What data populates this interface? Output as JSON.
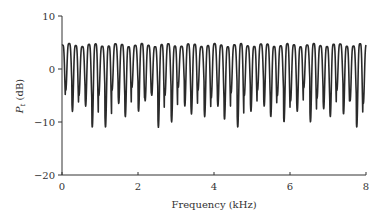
{
  "chart_data": {
    "type": "line",
    "title": "",
    "xlabel": "Frequency (kHz)",
    "ylabel": "P_t (dB)",
    "ylabel_main": "P",
    "ylabel_sub": "t",
    "ylabel_unit": " (dB)",
    "xlim": [
      0,
      8
    ],
    "ylim": [
      -20,
      10
    ],
    "xticks": [
      0,
      2,
      4,
      6,
      8
    ],
    "yticks": [
      10,
      0,
      -10,
      -20
    ],
    "xtick_labels": [
      "0",
      "2",
      "4",
      "6",
      "8"
    ],
    "ytick_labels": [
      "10",
      "0",
      "−10",
      "−20"
    ],
    "grid": false,
    "legend": null,
    "series": [
      {
        "name": "P_t",
        "description": "Comb-filter-like oscillation, approx. 46 cycles over 0-8 kHz; peaks near +4 to +5 dB, troughs ranging from about -3 dB to -11 dB",
        "period_khz": 0.174,
        "peak_db": 4.5,
        "trough_db": [
          -6.5,
          -4,
          -8,
          -5,
          -7,
          -11,
          -5,
          -11,
          -4,
          -6.5,
          -9,
          -3.5,
          -8,
          -6,
          -5,
          -11,
          -5,
          -10,
          -3.5,
          -7,
          -8.5,
          -4,
          -9,
          -5.5,
          -7,
          -9.5,
          -4.5,
          -11,
          -5,
          -8,
          -4,
          -7,
          -9,
          -5,
          -10,
          -6,
          -8,
          -3.5,
          -10,
          -5.5,
          -7.5,
          -9,
          -4,
          -8.5,
          -6,
          -11
        ]
      }
    ]
  }
}
